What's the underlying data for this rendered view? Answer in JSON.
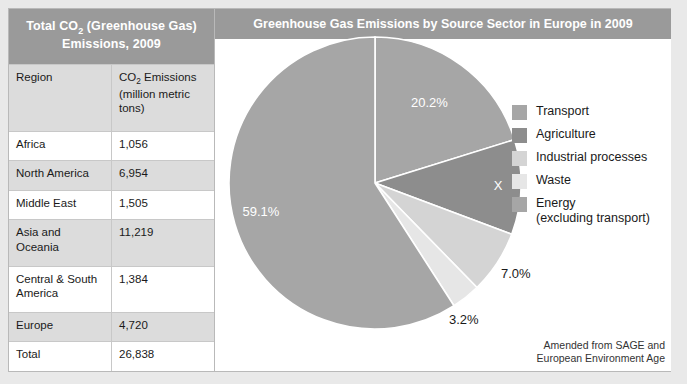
{
  "table": {
    "title_line1": "Total CO2 (Greenhouse Gas)",
    "title_line2": "Emissions, 2009",
    "title_main": "Total CO",
    "title_sub": "2",
    "title_rest": " (Greenhouse Gas)",
    "columns": {
      "region": "Region",
      "emissions_main": "CO",
      "emissions_sub": "2",
      "emissions_rest": " Emissions",
      "emissions_unit": "(million metric tons)"
    },
    "rows": [
      {
        "region": "Africa",
        "emissions": "1,056"
      },
      {
        "region": "North America",
        "emissions": "6,954"
      },
      {
        "region": "Middle East",
        "emissions": "1,505"
      },
      {
        "region": "Asia and Oceania",
        "emissions": "11,219"
      },
      {
        "region": "Central & South America",
        "emissions": "1,384"
      },
      {
        "region": "Europe",
        "emissions": "4,720"
      },
      {
        "region": "Total",
        "emissions": "26,838"
      }
    ]
  },
  "chart": {
    "title": "Greenhouse Gas Emissions by Source Sector in Europe in 2009",
    "credit": "Amended from SAGE and\nEuropean Environment Age"
  },
  "legend": {
    "items": [
      {
        "label": "Transport",
        "color": "#a6a6a6"
      },
      {
        "label": "Agriculture",
        "color": "#8d8d8d"
      },
      {
        "label": "Industrial processes",
        "color": "#d4d4d4"
      },
      {
        "label": "Waste",
        "color": "#e6e6e6"
      },
      {
        "label": "Energy\n(excluding transport)",
        "color": "#a6a6a6"
      }
    ]
  },
  "chart_data": {
    "type": "pie",
    "title": "Greenhouse Gas Emissions by Source Sector in Europe in 2009",
    "categories": [
      "Transport",
      "Agriculture",
      "Industrial processes",
      "Waste",
      "Energy (excluding transport)"
    ],
    "values": [
      20.2,
      10.5,
      7.0,
      3.2,
      59.1
    ],
    "labels": [
      "20.2%",
      "X",
      "7.0%",
      "3.2%",
      "59.1%"
    ],
    "colors": [
      "#a6a6a6",
      "#8d8d8d",
      "#d4d4d4",
      "#e6e6e6",
      "#a6a6a6"
    ],
    "unit": "percent",
    "legend_position": "right",
    "slice_separator_color": "#ffffff",
    "note": "Agriculture slice value is hidden and marked X"
  }
}
